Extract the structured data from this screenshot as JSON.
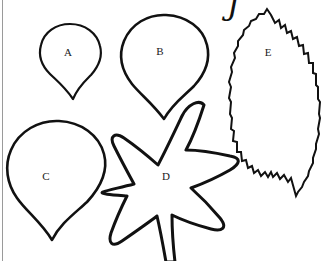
{
  "page": {
    "kind": "craft-template-worksheet",
    "background_color": "#ffffff",
    "ink_color": "#111111",
    "width": 323,
    "height": 261
  },
  "watermark": {
    "name": "cursive-signature-mark",
    "text": "J",
    "note_visible_fragment": "partially cropped cursive script at top edge"
  },
  "shapes": [
    {
      "id": "A",
      "label": "A",
      "name": "petal-template-a",
      "kind": "teardrop-petal",
      "label_x": 68,
      "label_y": 52,
      "outline_color": "#111111",
      "fill_color": "#ffffff"
    },
    {
      "id": "B",
      "label": "B",
      "name": "petal-template-b",
      "kind": "teardrop-petal",
      "label_x": 160,
      "label_y": 51,
      "outline_color": "#111111",
      "fill_color": "#ffffff"
    },
    {
      "id": "C",
      "label": "C",
      "name": "petal-template-c",
      "kind": "teardrop-petal",
      "label_x": 46,
      "label_y": 176,
      "outline_color": "#111111",
      "fill_color": "#ffffff"
    },
    {
      "id": "D",
      "label": "D",
      "name": "star-flower-template-d",
      "kind": "six-point-star-flower",
      "points": 6,
      "label_x": 166,
      "label_y": 176,
      "outline_color": "#111111",
      "fill_color": "#ffffff"
    },
    {
      "id": "E",
      "label": "E",
      "name": "serrated-leaf-template-e",
      "kind": "serrated-leaf",
      "label_x": 268,
      "label_y": 52,
      "outline_color": "#111111",
      "fill_color": "#ffffff"
    }
  ]
}
